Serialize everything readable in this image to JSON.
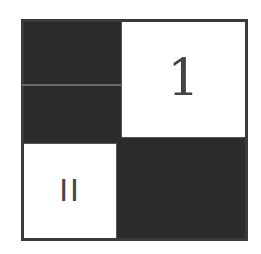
{
  "diagram": {
    "cells": [
      {
        "position": "top-left",
        "fill": "dark",
        "label": ""
      },
      {
        "position": "top-right",
        "fill": "white",
        "label": "1"
      },
      {
        "position": "bottom-left",
        "fill": "white",
        "label": "II"
      },
      {
        "position": "bottom-right",
        "fill": "dark",
        "label": ""
      }
    ],
    "colors": {
      "dark": "#2b2b2b",
      "white": "#ffffff",
      "divider": "#6a6a6a",
      "text": "#444444"
    }
  }
}
